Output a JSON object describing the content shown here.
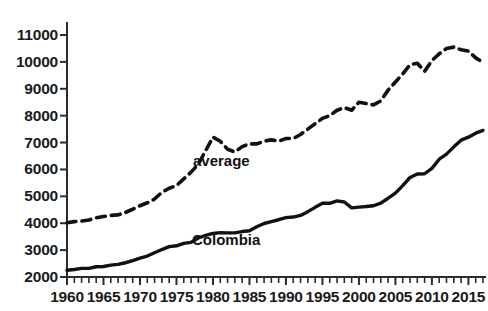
{
  "chart_data": {
    "type": "line",
    "title": "",
    "subtitle": "",
    "xlabel": "",
    "ylabel": "",
    "xlim": [
      1960,
      2017
    ],
    "ylim": [
      2000,
      11000
    ],
    "grid": false,
    "legend_position": "inline-annotation",
    "x_tick_labels": [
      "1960",
      "1965",
      "1970",
      "1975",
      "1980",
      "1985",
      "1990",
      "1995",
      "2000",
      "2005",
      "2010",
      "2015"
    ],
    "x_tick_values": [
      1960,
      1965,
      1970,
      1975,
      1980,
      1985,
      1990,
      1995,
      2000,
      2005,
      2010,
      2015
    ],
    "x_minor_tick_step": 1,
    "y_tick_labels": [
      "2000",
      "3000",
      "4000",
      "5000",
      "6000",
      "7000",
      "8000",
      "9000",
      "10000",
      "11000"
    ],
    "y_tick_values": [
      2000,
      3000,
      4000,
      5000,
      6000,
      7000,
      8000,
      9000,
      10000,
      11000
    ],
    "x": [
      1960,
      1961,
      1962,
      1963,
      1964,
      1965,
      1966,
      1967,
      1968,
      1969,
      1970,
      1971,
      1972,
      1973,
      1974,
      1975,
      1976,
      1977,
      1978,
      1979,
      1980,
      1981,
      1982,
      1983,
      1984,
      1985,
      1986,
      1987,
      1988,
      1989,
      1990,
      1991,
      1992,
      1993,
      1994,
      1995,
      1996,
      1997,
      1998,
      1999,
      2000,
      2001,
      2002,
      2003,
      2004,
      2005,
      2006,
      2007,
      2008,
      2009,
      2010,
      2011,
      2012,
      2013,
      2014,
      2015,
      2016,
      2017
    ],
    "series": [
      {
        "name": "average",
        "style": "dashed",
        "color": "#111111",
        "annotation": "average",
        "values": [
          4020,
          4060,
          4080,
          4120,
          4200,
          4250,
          4290,
          4310,
          4400,
          4520,
          4650,
          4760,
          4900,
          5150,
          5300,
          5400,
          5650,
          5900,
          6200,
          6700,
          7200,
          7050,
          6750,
          6650,
          6850,
          6950,
          6950,
          7050,
          7100,
          7050,
          7150,
          7150,
          7300,
          7500,
          7700,
          7900,
          8000,
          8200,
          8300,
          8200,
          8500,
          8450,
          8400,
          8550,
          8950,
          9250,
          9550,
          9900,
          9950,
          9650,
          10050,
          10300,
          10500,
          10550,
          10450,
          10400,
          10150,
          9980
        ]
      },
      {
        "name": "Colombia",
        "style": "solid",
        "color": "#111111",
        "annotation": "Colombia",
        "values": [
          2250,
          2280,
          2320,
          2320,
          2380,
          2390,
          2440,
          2470,
          2530,
          2610,
          2700,
          2780,
          2900,
          3020,
          3130,
          3160,
          3250,
          3290,
          3450,
          3550,
          3620,
          3650,
          3640,
          3640,
          3690,
          3720,
          3870,
          3990,
          4060,
          4130,
          4210,
          4230,
          4290,
          4430,
          4590,
          4740,
          4740,
          4830,
          4790,
          4570,
          4600,
          4620,
          4650,
          4750,
          4930,
          5120,
          5400,
          5700,
          5830,
          5840,
          6040,
          6380,
          6570,
          6840,
          7090,
          7200,
          7350,
          7450
        ]
      }
    ]
  },
  "axes": {
    "y_axis_name": "y-axis",
    "x_axis_name": "x-axis"
  }
}
